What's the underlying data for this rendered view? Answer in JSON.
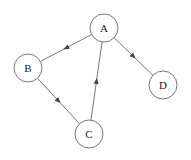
{
  "diagram": {
    "type": "directed-graph",
    "width": 191,
    "height": 160,
    "colors": {
      "background": "#ffffff",
      "stroke": "#777777",
      "arrow": "#444444",
      "label": "#222222"
    },
    "node_radius": 14,
    "nodes": [
      {
        "id": "A",
        "label": "A",
        "x": 104,
        "y": 28
      },
      {
        "id": "B",
        "label": "B",
        "x": 28,
        "y": 68
      },
      {
        "id": "C",
        "label": "C",
        "x": 89,
        "y": 134
      },
      {
        "id": "D",
        "label": "D",
        "x": 163,
        "y": 85
      }
    ],
    "edges": [
      {
        "from": "A",
        "to": "B"
      },
      {
        "from": "B",
        "to": "C"
      },
      {
        "from": "C",
        "to": "A"
      },
      {
        "from": "A",
        "to": "D"
      }
    ]
  }
}
